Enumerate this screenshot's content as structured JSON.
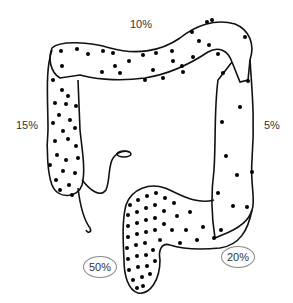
{
  "diagram": {
    "regions": [
      {
        "name": "transverse-colon",
        "percent": "10%"
      },
      {
        "name": "ascending-colon",
        "percent": "15%"
      },
      {
        "name": "descending-colon",
        "percent": "5%"
      },
      {
        "name": "rectum",
        "percent": "50%",
        "circled": true
      },
      {
        "name": "sigmoid-colon",
        "percent": "20%",
        "circled": true
      }
    ],
    "colors": {
      "outline": "#111111",
      "dot": "#000000",
      "label": "#333333",
      "oval": "#888888"
    }
  }
}
